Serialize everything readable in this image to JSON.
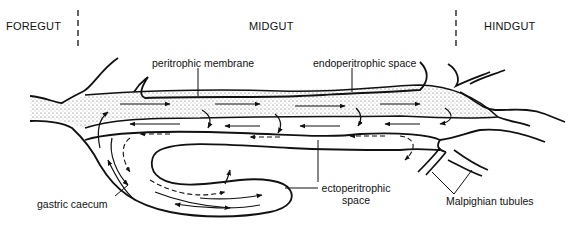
{
  "regions": {
    "foregut": "FOREGUT",
    "midgut": "MIDGUT",
    "hindgut": "HINDGUT"
  },
  "labels": {
    "peritrophic_membrane": "peritrophic membrane",
    "endoperitrophic_space": "endoperitrophic space",
    "ectoperitrophic_space_line1": "ectoperitrophic",
    "ectoperitrophic_space_line2": "space",
    "gastric_caecum": "gastric caecum",
    "malpighian_tubules": "Malpighian tubules"
  },
  "colors": {
    "ink": "#111111",
    "background": "#ffffff",
    "stipple": "#555555"
  }
}
